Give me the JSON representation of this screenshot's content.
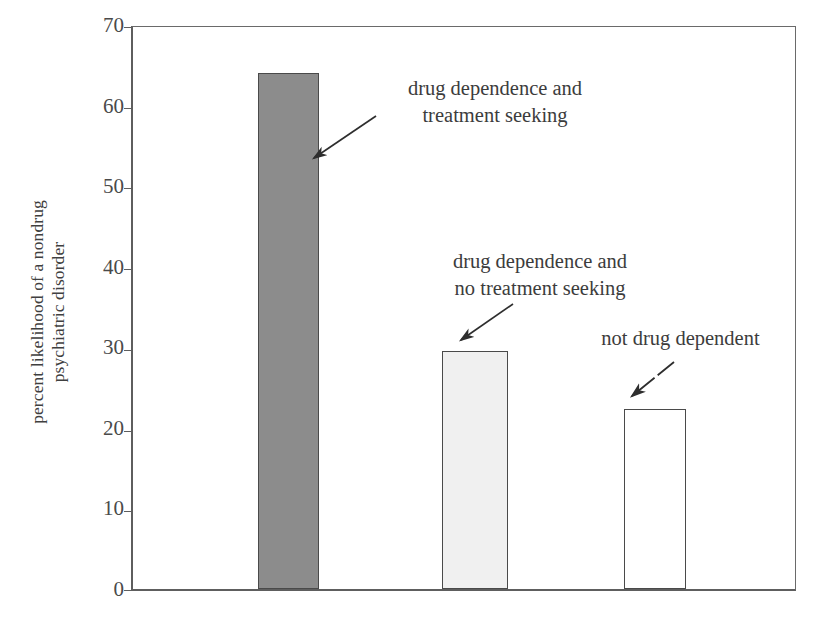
{
  "chart_data": {
    "type": "bar",
    "title": "",
    "subtitle": "",
    "xlabel": "",
    "ylabel": "percent likelihood of a nondrug psychiatric disorder",
    "ylabel_lines": [
      "percent likelihood of a nondrug",
      "psychiatric disorder"
    ],
    "ylim": [
      0,
      70
    ],
    "yticks": [
      0,
      10,
      20,
      30,
      40,
      50,
      60,
      70
    ],
    "ytick_labels": [
      "0",
      "10",
      "20",
      "30",
      "40",
      "50",
      "60",
      "70"
    ],
    "grid": false,
    "legend": "none",
    "categories": [
      "drug dependence and treatment seeking",
      "drug dependence and no treatment seeking",
      "not drug dependent"
    ],
    "values": [
      64.3,
      29.7,
      22.4
    ],
    "bar_colors": [
      "#8c8c8c",
      "#f0f0f0",
      "#ffffff"
    ],
    "bar_edge_color": "#4a4a4a",
    "annotations": [
      {
        "id": "ann-1",
        "lines": [
          "drug dependence and",
          "treatment seeking"
        ],
        "points_to": "bar-1",
        "arrow_style": "solid"
      },
      {
        "id": "ann-2",
        "lines": [
          "drug dependence and",
          "no treatment seeking"
        ],
        "points_to": "bar-2",
        "arrow_style": "solid"
      },
      {
        "id": "ann-3",
        "lines": [
          "not drug dependent"
        ],
        "points_to": "bar-3",
        "arrow_style": "dashed"
      }
    ]
  },
  "axis": {
    "line_color": "#5e5e5e",
    "background": "#ffffff"
  }
}
